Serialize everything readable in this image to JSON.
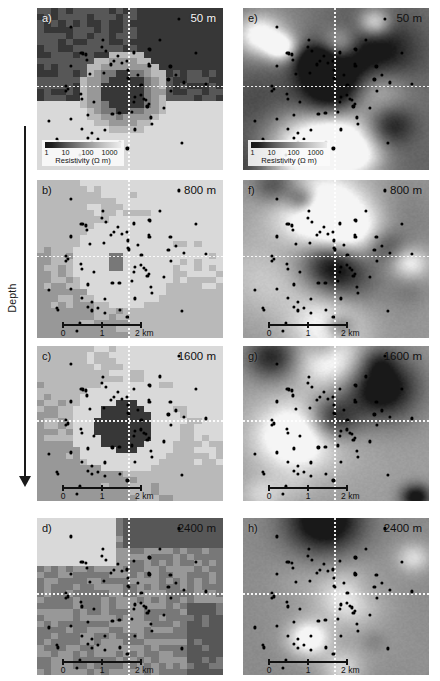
{
  "figure": {
    "axis": {
      "depth_label": "Depth",
      "arrow_direction": "down"
    },
    "colorbar": {
      "title": "Resistivity (Ω m)",
      "ticks": [
        "1",
        "10",
        "100",
        "1000"
      ],
      "tick_positions_pct": [
        2,
        27,
        56,
        85
      ],
      "scale": "log",
      "low_color": "#161616",
      "high_color": "#ededed"
    },
    "scalebar": {
      "labels": [
        "0",
        "1",
        "2 km"
      ],
      "tick_positions_pct": [
        0,
        50,
        100
      ],
      "length_km": 2
    }
  },
  "chart_data": {
    "type": "heatmap",
    "colormap": "grayscale-log",
    "cbar_label": "Resistivity (Ω m)",
    "cbar_range": [
      1,
      1000
    ],
    "xlabel": "",
    "ylabel": "",
    "grid": false,
    "legend": "none",
    "panels": [
      {
        "id": "a",
        "label": "a)",
        "depth": "50 m",
        "column": "left",
        "model": "blocky",
        "label_color": "light",
        "depth_color": "light",
        "has_colorbar": true,
        "has_scalebar": false
      },
      {
        "id": "b",
        "label": "b)",
        "depth": "800 m",
        "column": "left",
        "model": "blocky",
        "label_color": "dark",
        "depth_color": "dark",
        "has_colorbar": false,
        "has_scalebar": true
      },
      {
        "id": "c",
        "label": "c)",
        "depth": "1600 m",
        "column": "left",
        "model": "blocky",
        "label_color": "dark",
        "depth_color": "dark",
        "has_colorbar": false,
        "has_scalebar": true
      },
      {
        "id": "d",
        "label": "d)",
        "depth": "2400 m",
        "column": "left",
        "model": "blocky",
        "label_color": "dark",
        "depth_color": "dark",
        "has_colorbar": false,
        "has_scalebar": true
      },
      {
        "id": "e",
        "label": "e)",
        "depth": "50 m",
        "column": "right",
        "model": "smooth",
        "label_color": "dark",
        "depth_color": "dark",
        "has_colorbar": true,
        "has_scalebar": false
      },
      {
        "id": "f",
        "label": "f)",
        "depth": "800 m",
        "column": "right",
        "model": "smooth",
        "label_color": "dark",
        "depth_color": "dark",
        "has_colorbar": false,
        "has_scalebar": true
      },
      {
        "id": "g",
        "label": "g)",
        "depth": "1600 m",
        "column": "right",
        "model": "smooth",
        "label_color": "dark",
        "depth_color": "dark",
        "has_colorbar": false,
        "has_scalebar": true
      },
      {
        "id": "h",
        "label": "h)",
        "depth": "2400 m",
        "column": "right",
        "model": "smooth",
        "label_color": "dark",
        "depth_color": "dark",
        "has_colorbar": false,
        "has_scalebar": true
      }
    ],
    "depth_levels_m": [
      50,
      800,
      1600,
      2400
    ],
    "station_count_approx": 70
  }
}
